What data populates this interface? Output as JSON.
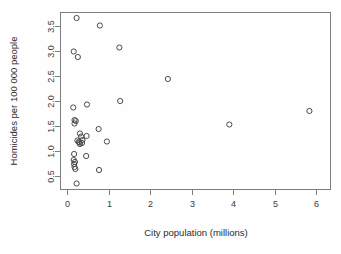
{
  "chart_data": {
    "type": "scatter",
    "title": "",
    "xlabel": "City population (millions)",
    "ylabel": "Homicides per 100 000 people",
    "xlim": [
      -0.18,
      6.35
    ],
    "ylim": [
      0.22,
      3.78
    ],
    "xticks": [
      0,
      1,
      2,
      3,
      4,
      5,
      6
    ],
    "xtick_labels": [
      "0",
      "1",
      "2",
      "3",
      "4",
      "5",
      "6"
    ],
    "yticks": [
      0.5,
      1.0,
      1.5,
      2.0,
      2.5,
      3.0,
      3.5
    ],
    "ytick_labels": [
      "0.5",
      "1.0",
      "1.5",
      "2.0",
      "2.5",
      "3.0",
      "3.5"
    ],
    "grid": false,
    "legend": false,
    "marker": "open-circle",
    "marker_size": 2.6,
    "point_color": "#4a4a4a",
    "axis_color": "#7d7d7d",
    "background": "#fefefe",
    "n_points": 34,
    "points": [
      {
        "x": 0.22,
        "y": 3.66
      },
      {
        "x": 0.78,
        "y": 3.51
      },
      {
        "x": 0.15,
        "y": 2.99
      },
      {
        "x": 1.25,
        "y": 3.07
      },
      {
        "x": 0.25,
        "y": 2.88
      },
      {
        "x": 2.42,
        "y": 2.44
      },
      {
        "x": 0.47,
        "y": 1.93
      },
      {
        "x": 1.27,
        "y": 2.0
      },
      {
        "x": 0.14,
        "y": 1.87
      },
      {
        "x": 5.83,
        "y": 1.8
      },
      {
        "x": 0.17,
        "y": 1.62
      },
      {
        "x": 0.17,
        "y": 1.55
      },
      {
        "x": 3.9,
        "y": 1.53
      },
      {
        "x": 0.75,
        "y": 1.44
      },
      {
        "x": 0.3,
        "y": 1.35
      },
      {
        "x": 0.33,
        "y": 1.29
      },
      {
        "x": 0.46,
        "y": 1.3
      },
      {
        "x": 0.24,
        "y": 1.21
      },
      {
        "x": 0.27,
        "y": 1.18
      },
      {
        "x": 0.29,
        "y": 1.17
      },
      {
        "x": 0.95,
        "y": 1.19
      },
      {
        "x": 0.16,
        "y": 0.94
      },
      {
        "x": 0.45,
        "y": 0.9
      },
      {
        "x": 0.15,
        "y": 0.82
      },
      {
        "x": 0.16,
        "y": 0.74
      },
      {
        "x": 0.17,
        "y": 0.68
      },
      {
        "x": 0.19,
        "y": 0.64
      },
      {
        "x": 0.76,
        "y": 0.62
      },
      {
        "x": 0.22,
        "y": 0.35
      },
      {
        "x": 0.2,
        "y": 1.6
      },
      {
        "x": 0.36,
        "y": 1.22
      },
      {
        "x": 0.35,
        "y": 1.16
      },
      {
        "x": 0.18,
        "y": 0.78
      },
      {
        "x": 0.3,
        "y": 1.14
      }
    ]
  },
  "figure": {
    "plot_left_px": 60,
    "plot_right_px": 331,
    "plot_top_px": 12,
    "plot_bottom_px": 190
  }
}
